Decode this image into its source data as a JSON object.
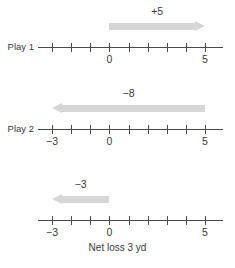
{
  "figure": {
    "title": "",
    "caption": "Net loss 3 yd",
    "colors": {
      "axis": "#4a4a4a",
      "text": "#3a3a3a",
      "arrow": "#d6d6d6",
      "background": "#ffffff"
    }
  },
  "chart_data": {
    "type": "line",
    "title": "",
    "xlabel": "",
    "ylabel": "",
    "xlim": [
      -3,
      5
    ],
    "grid": false,
    "legend": "none",
    "number_lines": [
      {
        "id": "play-1",
        "row_label": "Play 1",
        "tick_values": [
          -3,
          -2,
          -1,
          0,
          1,
          2,
          3,
          4,
          5
        ],
        "labeled_ticks": [
          {
            "value": 0,
            "text": "0"
          },
          {
            "value": 5,
            "text": "5"
          }
        ],
        "arrow": {
          "label": "+5",
          "from": 0,
          "to": 5,
          "direction": "right",
          "magnitude": 5
        }
      },
      {
        "id": "play-2",
        "row_label": "Play 2",
        "tick_values": [
          -3,
          -2,
          -1,
          0,
          1,
          2,
          3,
          4,
          5
        ],
        "labeled_ticks": [
          {
            "value": -3,
            "text": "−3"
          },
          {
            "value": 0,
            "text": "0"
          },
          {
            "value": 5,
            "text": "5"
          }
        ],
        "arrow": {
          "label": "−8",
          "from": 5,
          "to": -3,
          "direction": "left",
          "magnitude": 8
        }
      },
      {
        "id": "net-result",
        "row_label": "",
        "tick_values": [
          -3,
          -2,
          -1,
          0,
          1,
          2,
          3,
          4,
          5
        ],
        "labeled_ticks": [
          {
            "value": -3,
            "text": "−3"
          },
          {
            "value": 0,
            "text": "0"
          },
          {
            "value": 5,
            "text": "5"
          }
        ],
        "arrow": {
          "label": "−3",
          "from": 0,
          "to": -3,
          "direction": "left",
          "magnitude": 3
        }
      }
    ]
  }
}
